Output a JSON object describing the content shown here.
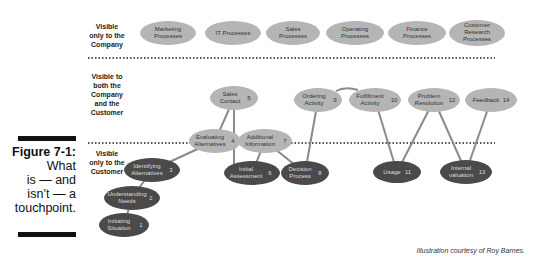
{
  "figure": {
    "number": "Figure 7-1:",
    "caption_lines": [
      "What",
      "is — and",
      "isn’t — a",
      "touchpoint."
    ]
  },
  "zones": [
    {
      "id": "company-only",
      "label_lines": [
        "Visible",
        "only to the",
        "Company"
      ]
    },
    {
      "id": "both",
      "label_lines": [
        "Visible to",
        "both the",
        "Company",
        "and the",
        "Customer"
      ]
    },
    {
      "id": "customer-only",
      "label_lines": [
        "Visible",
        "only to the",
        "Customer"
      ]
    }
  ],
  "company_processes": [
    {
      "label_lines": [
        "Marketing",
        "Processes"
      ]
    },
    {
      "label_lines": [
        "IT Processes"
      ]
    },
    {
      "label_lines": [
        "Sales",
        "Processes"
      ]
    },
    {
      "label_lines": [
        "Operating",
        "Processes"
      ]
    },
    {
      "label_lines": [
        "Finance",
        "Processes"
      ]
    },
    {
      "label_lines": [
        "Customer",
        "Research",
        "Processes"
      ]
    }
  ],
  "touchpoints": [
    {
      "num": "1",
      "label_lines": [
        "Initiating",
        "Situation"
      ],
      "zone": "customer-only"
    },
    {
      "num": "2",
      "label_lines": [
        "Understanding",
        "Needs"
      ],
      "zone": "customer-only"
    },
    {
      "num": "3",
      "label_lines": [
        "Identifying",
        "Alternatives"
      ],
      "zone": "customer-only"
    },
    {
      "num": "4",
      "label_lines": [
        "Evaluating",
        "Alternatives"
      ],
      "zone": "boundary"
    },
    {
      "num": "5",
      "label_lines": [
        "Sales",
        "Contact"
      ],
      "zone": "both"
    },
    {
      "num": "6",
      "label_lines": [
        "Initial",
        "Assessment"
      ],
      "zone": "customer-only"
    },
    {
      "num": "7",
      "label_lines": [
        "Additional",
        "Information"
      ],
      "zone": "boundary"
    },
    {
      "num": "8",
      "label_lines": [
        "Decision",
        "Process"
      ],
      "zone": "customer-only"
    },
    {
      "num": "9",
      "label_lines": [
        "Ordering",
        "Activity"
      ],
      "zone": "both"
    },
    {
      "num": "10",
      "label_lines": [
        "Fulfillment",
        "Activity"
      ],
      "zone": "both"
    },
    {
      "num": "11",
      "label_lines": [
        "Usage"
      ],
      "zone": "customer-only"
    },
    {
      "num": "12",
      "label_lines": [
        "Problem",
        "Resolution"
      ],
      "zone": "both"
    },
    {
      "num": "13",
      "label_lines": [
        "Internal",
        "valuation"
      ],
      "zone": "customer-only"
    },
    {
      "num": "14",
      "label_lines": [
        "Feedback"
      ],
      "zone": "both"
    }
  ],
  "colors": {
    "light_node": "#b5b5b5",
    "dark_node": "#4a4a4a",
    "line": "#8a8a8a",
    "dotted": "#555555"
  },
  "credit": "Illustration courtesy of Roy Barnes."
}
